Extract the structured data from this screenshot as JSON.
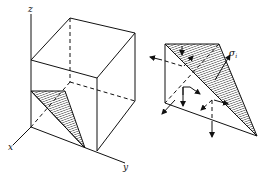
{
  "figure": {
    "left_panel": {
      "description": "cube with coordinate axes and shaded triangular plane at corner",
      "axes": {
        "z_label": "z",
        "x_label": "x",
        "y_label": "y"
      }
    },
    "right_panel": {
      "description": "tetrahedron element with shaded oblique face and stress vectors",
      "stress_label": "σ",
      "stress_subscript": "i"
    },
    "colors": {
      "line": "#111111",
      "background": "#ffffff"
    }
  }
}
